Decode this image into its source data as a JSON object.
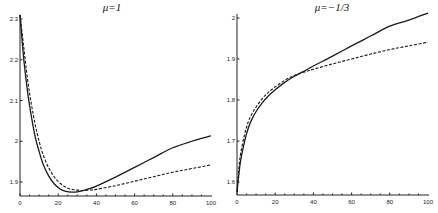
{
  "chart_data": [
    {
      "type": "line",
      "title": "μ=1",
      "xlabel": "",
      "ylabel": "",
      "xlim": [
        0,
        100
      ],
      "ylim": [
        1.866,
        2.31
      ],
      "xticks": [
        0,
        20,
        40,
        60,
        80,
        100
      ],
      "yticks": [
        1.9,
        2,
        2.1,
        2.2,
        2.3
      ],
      "ytick_labels": [
        "1.9",
        "2",
        "2.1",
        "2.2",
        "2.3"
      ],
      "grid": false,
      "legend": null,
      "series": [
        {
          "name": "solid",
          "style": "solid",
          "x": [
            0,
            2,
            4,
            6,
            8,
            10,
            12,
            15,
            18,
            21,
            24,
            27,
            30,
            33,
            36,
            40,
            50,
            60,
            70,
            80,
            90,
            100
          ],
          "y": [
            2.31,
            2.2,
            2.12,
            2.06,
            2.01,
            1.975,
            1.945,
            1.915,
            1.895,
            1.883,
            1.877,
            1.875,
            1.876,
            1.879,
            1.883,
            1.89,
            1.912,
            1.936,
            1.96,
            1.984,
            2.0,
            2.013
          ]
        },
        {
          "name": "dashed",
          "style": "dashed",
          "x": [
            0,
            2,
            4,
            6,
            8,
            10,
            12,
            15,
            18,
            21,
            24,
            27,
            30,
            33,
            36,
            40,
            50,
            60,
            70,
            80,
            90,
            100
          ],
          "y": [
            2.31,
            2.23,
            2.15,
            2.09,
            2.04,
            2.0,
            1.968,
            1.935,
            1.912,
            1.897,
            1.887,
            1.882,
            1.88,
            1.879,
            1.88,
            1.882,
            1.891,
            1.902,
            1.913,
            1.924,
            1.933,
            1.942
          ]
        }
      ]
    },
    {
      "type": "line",
      "title": "μ=−1/3",
      "xlabel": "",
      "ylabel": "",
      "xlim": [
        0,
        100
      ],
      "ylim": [
        1.568,
        2.01
      ],
      "xticks": [
        0,
        20,
        40,
        60,
        80,
        100
      ],
      "yticks": [
        1.6,
        1.7,
        1.8,
        1.9,
        2
      ],
      "ytick_labels": [
        "1.6",
        "1.7",
        "1.8",
        "1.9",
        "2"
      ],
      "grid": false,
      "legend": null,
      "series": [
        {
          "name": "solid",
          "style": "solid",
          "x": [
            0,
            1,
            2,
            4,
            6,
            8,
            10,
            13,
            16,
            20,
            25,
            30,
            35,
            40,
            50,
            60,
            70,
            80,
            90,
            100
          ],
          "y": [
            1.575,
            1.62,
            1.655,
            1.7,
            1.733,
            1.755,
            1.772,
            1.792,
            1.808,
            1.825,
            1.843,
            1.858,
            1.87,
            1.883,
            1.907,
            1.932,
            1.956,
            1.98,
            1.995,
            2.012
          ]
        },
        {
          "name": "dashed",
          "style": "dashed",
          "x": [
            0,
            1,
            2,
            4,
            6,
            8,
            10,
            13,
            16,
            20,
            25,
            30,
            35,
            40,
            50,
            60,
            70,
            80,
            90,
            100
          ],
          "y": [
            1.575,
            1.635,
            1.672,
            1.717,
            1.748,
            1.768,
            1.783,
            1.802,
            1.817,
            1.832,
            1.848,
            1.86,
            1.868,
            1.875,
            1.888,
            1.9,
            1.912,
            1.923,
            1.932,
            1.941
          ]
        }
      ]
    }
  ],
  "panels": [
    {
      "title": "μ=1",
      "xtick_labels": [
        "0",
        "20",
        "40",
        "60",
        "80",
        "100"
      ],
      "ytick_labels": [
        "2.3",
        "2.2",
        "2.1",
        "2",
        "1.9"
      ]
    },
    {
      "title": "μ=−1/3",
      "xtick_labels": [
        "0",
        "20",
        "40",
        "60",
        "80",
        "100"
      ],
      "ytick_labels": [
        "2",
        "1.9",
        "1.8",
        "1.7",
        "1.6"
      ]
    }
  ]
}
